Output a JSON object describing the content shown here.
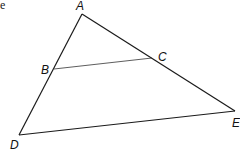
{
  "fragment_text": "e",
  "diagram": {
    "type": "triangle-with-segment",
    "points": {
      "A": {
        "label": "A",
        "x": 82,
        "y": 14
      },
      "B": {
        "label": "B",
        "x": 54,
        "y": 69
      },
      "C": {
        "label": "C",
        "x": 152,
        "y": 58
      },
      "D": {
        "label": "D",
        "x": 19,
        "y": 135
      },
      "E": {
        "label": "E",
        "x": 235,
        "y": 111
      }
    },
    "segments": [
      "AD",
      "AE",
      "DE",
      "BC"
    ],
    "line_color": "#1a1a1a"
  }
}
